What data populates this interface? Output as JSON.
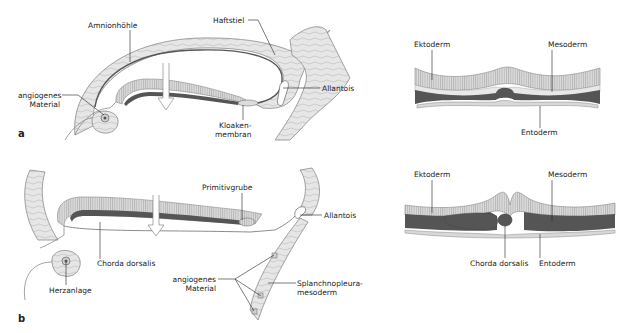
{
  "figure": {
    "panel_a": {
      "letter": "a",
      "labels": {
        "amnionhoehle": "Amnionhöhle",
        "haftstiel": "Haftstiel",
        "allantois": "Allantois",
        "angiogenes_1": "angiogenes",
        "angiogenes_2": "Material",
        "kloaken_1": "Kloaken-",
        "kloaken_2": "membran"
      },
      "cross_section": {
        "ektoderm": "Ektoderm",
        "mesoderm": "Mesoderm",
        "entoderm": "Entoderm"
      }
    },
    "panel_b": {
      "letter": "b",
      "labels": {
        "primitivgrube": "Primitivgrube",
        "allantois": "Allantois",
        "chorda": "Chorda dorsalis",
        "herzanlage": "Herzanlage",
        "angiogenes_1": "angiogenes",
        "angiogenes_2": "Material",
        "splanch_1": "Splanchnopleura-",
        "splanch_2": "mesoderm"
      },
      "cross_section": {
        "ektoderm": "Ektoderm",
        "mesoderm": "Mesoderm",
        "chorda": "Chorda dorsalis",
        "entoderm": "Entoderm"
      }
    },
    "colors": {
      "tissue_fill": "#e3e3e3",
      "tissue_stroke": "#8c8c8c",
      "ectoderm_fill": "#d6d6d6",
      "mesoderm_dark": "#555555",
      "outline": "#444444",
      "leader": "#222222"
    }
  }
}
